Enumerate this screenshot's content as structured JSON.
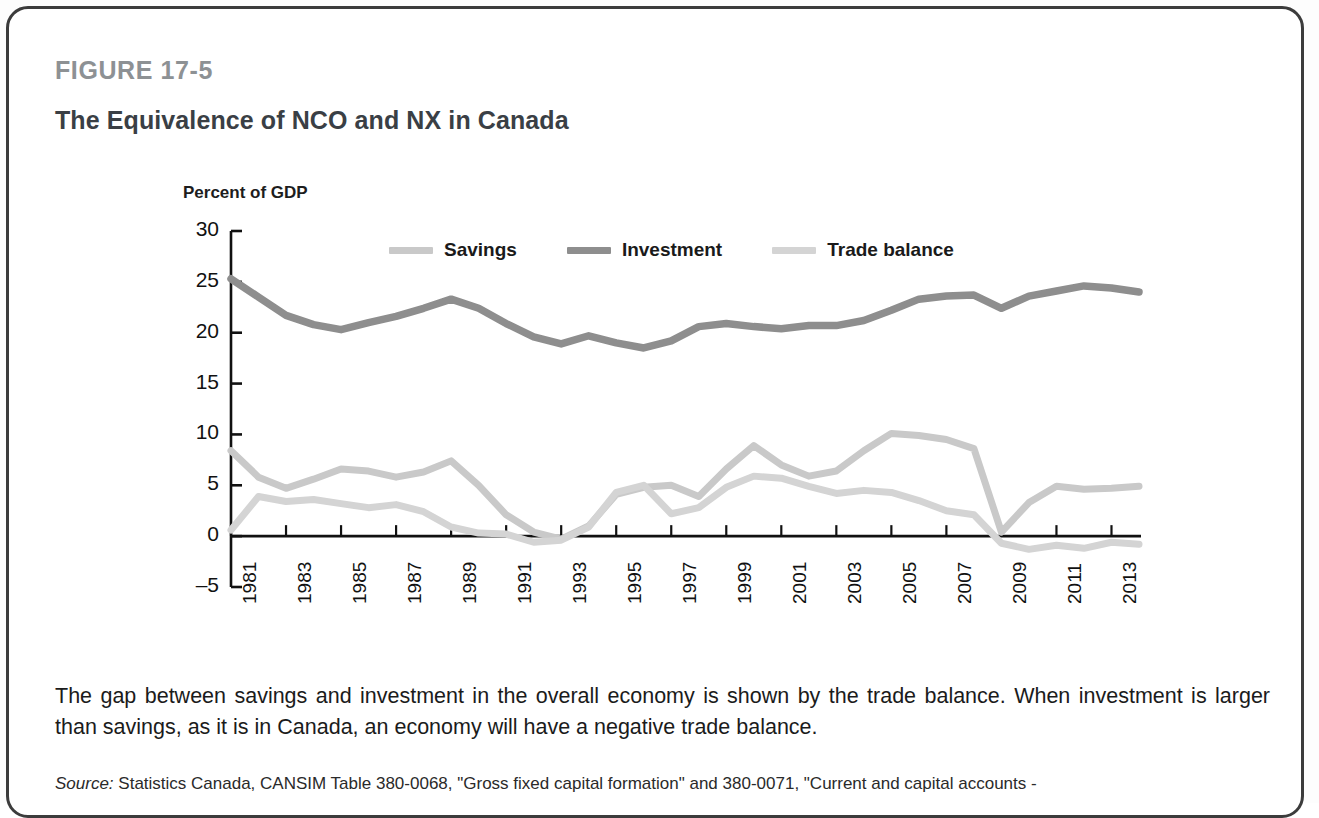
{
  "figure": {
    "label": "FIGURE 17-5",
    "title": "The Equivalence of NCO and NX in Canada"
  },
  "caption": "The gap between savings and investment in the overall economy is shown by the trade balance. When investment is larger than savings, as it is in Canada, an economy will have a negative trade balance.",
  "source": {
    "prefix": "Source:",
    "text": " Statistics Canada, CANSIM Table 380-0068, \"Gross fixed capital formation\" and 380-0071, \"Current and capital accounts -"
  },
  "colors": {
    "savings": "#c9c9c9",
    "investment": "#8e8e8e",
    "trade_balance": "#d4d4d4",
    "axis": "#111111",
    "figure_label": "#8d9194",
    "title": "#3a3f45",
    "frame": "#3c3c3c"
  },
  "chart_data": {
    "type": "line",
    "title": "The Equivalence of NCO and NX in Canada",
    "xlabel": "",
    "ylabel": "Percent of GDP",
    "ylim": [
      -5,
      30
    ],
    "yticks": [
      -5,
      0,
      5,
      10,
      15,
      20,
      25,
      30
    ],
    "ytick_labels": [
      "–5",
      "0",
      "5",
      "10",
      "15",
      "20",
      "25",
      "30"
    ],
    "xlim": [
      1981,
      2014
    ],
    "xticks": [
      1981,
      1983,
      1985,
      1987,
      1989,
      1991,
      1993,
      1995,
      1997,
      1999,
      2001,
      2003,
      2005,
      2007,
      2009,
      2011,
      2013
    ],
    "xtick_labels": [
      "1981",
      "1983",
      "1985",
      "1987",
      "1989",
      "1991",
      "1993",
      "1995",
      "1997",
      "1999",
      "2001",
      "2003",
      "2005",
      "2007",
      "2009",
      "2011",
      "2013"
    ],
    "grid": false,
    "legend_position": "top-center",
    "x": [
      1981,
      1982,
      1983,
      1984,
      1985,
      1986,
      1987,
      1988,
      1989,
      1990,
      1991,
      1992,
      1993,
      1994,
      1995,
      1996,
      1997,
      1998,
      1999,
      2000,
      2001,
      2002,
      2003,
      2004,
      2005,
      2006,
      2007,
      2008,
      2009,
      2010,
      2011,
      2012,
      2013,
      2014
    ],
    "series": [
      {
        "name": "Savings",
        "color": "#c9c9c9",
        "values": [
          8.4,
          5.8,
          4.7,
          5.6,
          6.6,
          6.4,
          5.8,
          6.3,
          7.4,
          5.0,
          2.1,
          0.4,
          -0.3,
          1.0,
          4.1,
          4.8,
          5.0,
          3.9,
          6.6,
          8.9,
          7.0,
          5.9,
          6.4,
          8.4,
          10.1,
          9.9,
          9.5,
          8.6,
          0.4,
          3.3,
          4.9,
          4.6,
          4.7,
          4.9
        ]
      },
      {
        "name": "Investment",
        "color": "#8e8e8e",
        "values": [
          25.3,
          23.5,
          21.7,
          20.8,
          20.3,
          21.0,
          21.6,
          22.4,
          23.3,
          22.4,
          20.9,
          19.6,
          18.9,
          19.7,
          19.0,
          18.5,
          19.2,
          20.6,
          20.9,
          20.6,
          20.4,
          20.7,
          20.7,
          21.2,
          22.2,
          23.3,
          23.6,
          23.7,
          22.4,
          23.6,
          24.1,
          24.6,
          24.4,
          24.0
        ]
      },
      {
        "name": "Trade balance",
        "color": "#d4d4d4",
        "values": [
          0.6,
          3.9,
          3.4,
          3.6,
          3.2,
          2.8,
          3.1,
          2.4,
          0.9,
          0.3,
          0.2,
          -0.6,
          -0.4,
          0.9,
          4.3,
          5.0,
          2.2,
          2.8,
          4.8,
          5.9,
          5.7,
          4.9,
          4.2,
          4.5,
          4.3,
          3.5,
          2.5,
          2.1,
          -0.7,
          -1.3,
          -0.9,
          -1.2,
          -0.6,
          -0.8
        ]
      }
    ]
  },
  "legend": {
    "items": [
      {
        "label": "Savings",
        "color": "#c9c9c9"
      },
      {
        "label": "Investment",
        "color": "#8e8e8e"
      },
      {
        "label": "Trade balance",
        "color": "#d4d4d4"
      }
    ]
  }
}
